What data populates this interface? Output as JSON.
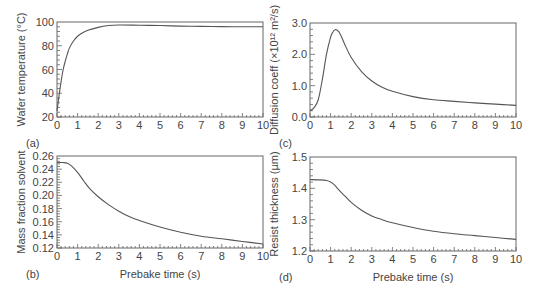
{
  "chart_data": [
    {
      "id": "a",
      "type": "line",
      "panel_label": "(a)",
      "title": "",
      "xlabel": "",
      "ylabel": "Wafer temperature (°C)",
      "xlim": [
        0,
        10
      ],
      "ylim": [
        20,
        100
      ],
      "xticks": [
        0,
        1,
        2,
        3,
        4,
        5,
        6,
        7,
        8,
        9,
        10
      ],
      "yticks": [
        20,
        40,
        60,
        80,
        100
      ],
      "ytick_labels": [
        "20",
        "40",
        "60",
        "80",
        "100"
      ],
      "frame": {
        "x0": 57,
        "y0": 22,
        "x1": 263,
        "y1": 117
      },
      "series": [
        {
          "name": "Wafer temperature",
          "x": [
            0,
            0.1,
            0.2,
            0.3,
            0.4,
            0.5,
            0.6,
            0.8,
            1.0,
            1.2,
            1.5,
            2.0,
            2.5,
            3.0,
            4.0,
            5.0,
            6.0,
            7.0,
            8.0,
            9.0,
            10.0
          ],
          "y": [
            25,
            38,
            50,
            60,
            67,
            73,
            78,
            84,
            88,
            90.5,
            93,
            95.5,
            97,
            97.5,
            97.3,
            97,
            96.5,
            96.3,
            96.1,
            96,
            96
          ]
        }
      ]
    },
    {
      "id": "c",
      "type": "line",
      "panel_label": "(c)",
      "title": "",
      "xlabel": "",
      "ylabel": "Diffusion coeff (×10¹² m²/s)",
      "xlim": [
        0,
        10
      ],
      "ylim": [
        0,
        3.0
      ],
      "xticks": [
        0,
        1,
        2,
        3,
        4,
        5,
        6,
        7,
        8,
        9,
        10
      ],
      "yticks": [
        0,
        1.0,
        2.0,
        3.0
      ],
      "ytick_labels": [
        "0.0",
        "1.0",
        "2.0",
        "3.0"
      ],
      "frame": {
        "x0": 310,
        "y0": 23,
        "x1": 516,
        "y1": 117
      },
      "series": [
        {
          "name": "Diffusion coefficient",
          "x": [
            0,
            0.2,
            0.4,
            0.6,
            0.8,
            1.0,
            1.1,
            1.2,
            1.3,
            1.4,
            1.5,
            1.7,
            2.0,
            2.5,
            3.0,
            3.5,
            4.0,
            5.0,
            6.0,
            7.0,
            8.0,
            9.0,
            10.0
          ],
          "y": [
            0.2,
            0.3,
            0.55,
            1.2,
            2.0,
            2.55,
            2.7,
            2.78,
            2.78,
            2.72,
            2.6,
            2.3,
            1.9,
            1.45,
            1.15,
            0.95,
            0.82,
            0.65,
            0.55,
            0.5,
            0.45,
            0.41,
            0.37
          ]
        }
      ]
    },
    {
      "id": "b",
      "type": "line",
      "panel_label": "(b)",
      "title": "",
      "xlabel": "Prebake time (s)",
      "ylabel": "Mass fraction solvent",
      "xlim": [
        0,
        10
      ],
      "ylim": [
        0.12,
        0.26
      ],
      "xticks": [
        0,
        1,
        2,
        3,
        4,
        5,
        6,
        7,
        8,
        9,
        10
      ],
      "yticks": [
        0.12,
        0.14,
        0.16,
        0.18,
        0.2,
        0.22,
        0.24,
        0.26
      ],
      "ytick_labels": [
        "0.12",
        "0.14",
        "0.16",
        "0.18",
        "0.20",
        "0.22",
        "0.24",
        "0.26"
      ],
      "frame": {
        "x0": 57,
        "y0": 156,
        "x1": 263,
        "y1": 248
      },
      "series": [
        {
          "name": "Mass fraction solvent",
          "x": [
            0,
            0.3,
            0.5,
            0.7,
            1.0,
            1.3,
            1.6,
            2.0,
            2.5,
            3.0,
            3.5,
            4.0,
            5.0,
            6.0,
            7.0,
            8.0,
            9.0,
            10.0
          ],
          "y": [
            0.25,
            0.25,
            0.249,
            0.245,
            0.235,
            0.222,
            0.21,
            0.198,
            0.186,
            0.176,
            0.168,
            0.162,
            0.152,
            0.144,
            0.138,
            0.134,
            0.13,
            0.126
          ]
        }
      ]
    },
    {
      "id": "d",
      "type": "line",
      "panel_label": "(d)",
      "title": "",
      "xlabel": "Prebake time (s)",
      "ylabel": "Resist thickness (µm)",
      "xlim": [
        0,
        10
      ],
      "ylim": [
        1.2,
        1.5
      ],
      "xticks": [
        0,
        1,
        2,
        3,
        4,
        5,
        6,
        7,
        8,
        9,
        10
      ],
      "yticks": [
        1.2,
        1.3,
        1.4,
        1.5
      ],
      "ytick_labels": [
        "1.2",
        "1.3",
        "1.4",
        "1.5"
      ],
      "frame": {
        "x0": 310,
        "y0": 157,
        "x1": 516,
        "y1": 251
      },
      "series": [
        {
          "name": "Resist thickness",
          "x": [
            0,
            0.5,
            0.8,
            1.0,
            1.2,
            1.4,
            1.7,
            2.0,
            2.5,
            3.0,
            3.5,
            4.0,
            5.0,
            6.0,
            7.0,
            8.0,
            9.0,
            10.0
          ],
          "y": [
            1.428,
            1.427,
            1.425,
            1.42,
            1.41,
            1.395,
            1.375,
            1.355,
            1.33,
            1.312,
            1.3,
            1.29,
            1.275,
            1.263,
            1.255,
            1.249,
            1.243,
            1.237
          ]
        }
      ]
    }
  ]
}
